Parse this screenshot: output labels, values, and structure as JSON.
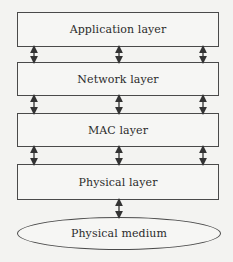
{
  "diagram": {
    "type": "layered protocol stack",
    "layers": [
      {
        "label": "Application layer"
      },
      {
        "label": "Network layer"
      },
      {
        "label": "MAC layer"
      },
      {
        "label": "Physical layer"
      }
    ],
    "medium": {
      "label": "Physical medium"
    },
    "connections": {
      "between_layers": "bidirectional arrows (3 per gap: left, center, right)",
      "layer_to_medium": "single bidirectional arrow (center)"
    },
    "colors": {
      "stroke": "#4a4a4a",
      "background": "#f3f3f1",
      "text": "#2b2b2b"
    }
  }
}
